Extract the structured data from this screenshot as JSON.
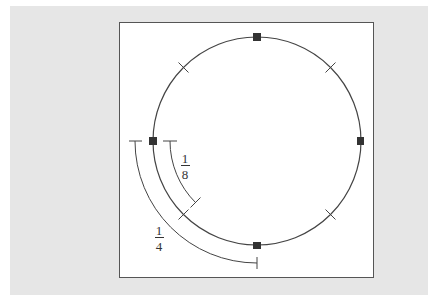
{
  "figure": {
    "colors": {
      "backdrop": "#e6e6e6",
      "frame_border": "#555555",
      "stroke": "#444444",
      "marker": "#333333"
    },
    "circle": {
      "center": [
        257,
        141
      ],
      "radius": 104,
      "quarter_markers": [
        "top",
        "right",
        "bottom",
        "left"
      ],
      "eighth_ticks": [
        "upper-left",
        "upper-right",
        "lower-right",
        "lower-left"
      ]
    },
    "annotations": [
      {
        "id": "one-eighth",
        "numerator": "1",
        "denominator": "8",
        "arc_radius": 87,
        "from": "left",
        "to": "lower-left"
      },
      {
        "id": "one-quarter",
        "numerator": "1",
        "denominator": "4",
        "arc_radius": 122,
        "from": "left",
        "to": "bottom"
      }
    ]
  }
}
